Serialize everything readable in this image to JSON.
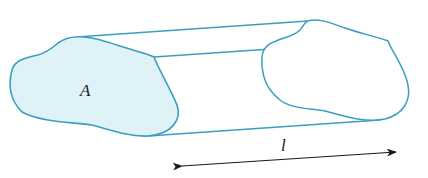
{
  "diagram": {
    "labels": {
      "area": "A",
      "length": "l"
    },
    "colors": {
      "outline": "#3a9fbf",
      "fill": "#dff2f7",
      "arrow": "#1a1a1a"
    }
  }
}
